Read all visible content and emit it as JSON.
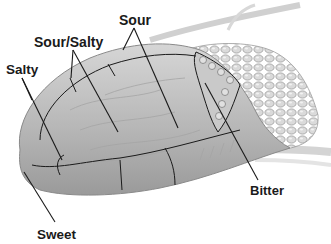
{
  "diagram": {
    "caption_fragment": "",
    "colors": {
      "tongue_fill": "#b9b9b9",
      "tongue_highlight": "#dcdcdc",
      "tongue_shadow": "#8e8e8e",
      "papillae_fill": "#d2d2d2",
      "outline": "#1a1a1a",
      "background": "#ffffff"
    },
    "labels": [
      {
        "id": "sour",
        "text": "Sour"
      },
      {
        "id": "sour_salty",
        "text": "Sour/Salty"
      },
      {
        "id": "salty",
        "text": "Salty"
      },
      {
        "id": "sweet",
        "text": "Sweet"
      },
      {
        "id": "bitter",
        "text": "Bitter"
      }
    ]
  }
}
